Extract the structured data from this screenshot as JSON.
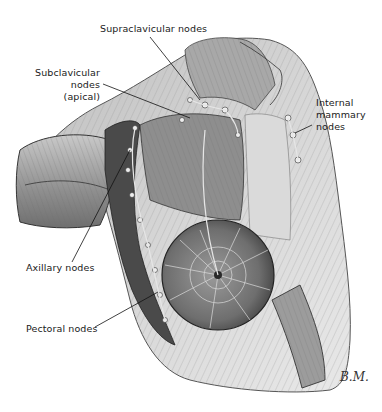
{
  "figure": {
    "labels": [
      {
        "id": "supraclavicular",
        "text": "Supraclavicular nodes"
      },
      {
        "id": "subclavicular",
        "lines": [
          "Subclavicular",
          "nodes",
          "(apical)"
        ]
      },
      {
        "id": "internal-mammary",
        "lines": [
          "Internal",
          "mammary",
          "nodes"
        ]
      },
      {
        "id": "axillary",
        "text": "Axillary nodes"
      },
      {
        "id": "pectoral",
        "text": "Pectoral nodes"
      }
    ],
    "signature": "B.M.",
    "colors": {
      "background": "#ffffff",
      "ink": "#1a1a1a",
      "muscle_light": "#cfcfcf",
      "muscle_mid": "#9a9a9a",
      "muscle_dark": "#4a4a4a",
      "node": "#e6e6e6"
    }
  }
}
